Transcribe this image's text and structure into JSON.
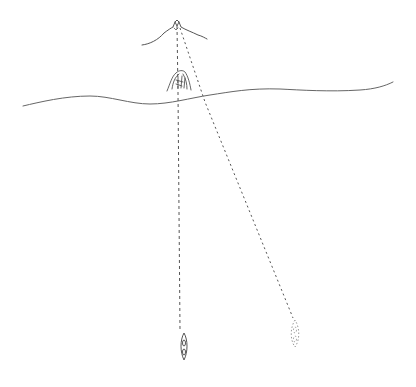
{
  "diagram": {
    "type": "hand-drawn sketch",
    "elements": {
      "mountain": "mountain-peak",
      "landmark": "rock-landmark",
      "shoreline": "horizon-line",
      "boat_a": "solid-boat",
      "boat_b": "ghost-boat"
    },
    "colors": {
      "ink": "#555555",
      "background": "#ffffff"
    }
  }
}
